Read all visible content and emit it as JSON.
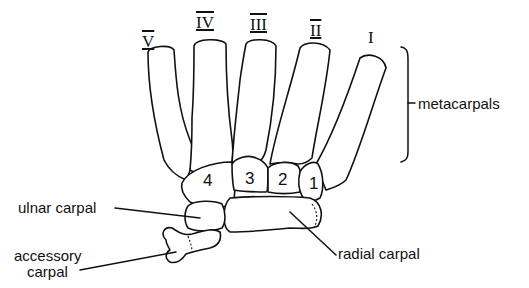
{
  "diagram": {
    "roman_labels": [
      {
        "id": "V",
        "text": "V"
      },
      {
        "id": "IV",
        "text": "IV"
      },
      {
        "id": "III",
        "text": "III"
      },
      {
        "id": "II",
        "text": "II"
      },
      {
        "id": "I",
        "text": "I"
      }
    ],
    "carpal_numbers": [
      "4",
      "3",
      "2",
      "1"
    ],
    "labels": {
      "metacarpals": "metacarpals",
      "ulnar_carpal": "ulnar carpal",
      "accessory_carpal_line1": "accessory",
      "accessory_carpal_line2": "carpal",
      "radial_carpal": "radial carpal"
    },
    "colors": {
      "ink": "#111111",
      "background": "#ffffff"
    }
  }
}
